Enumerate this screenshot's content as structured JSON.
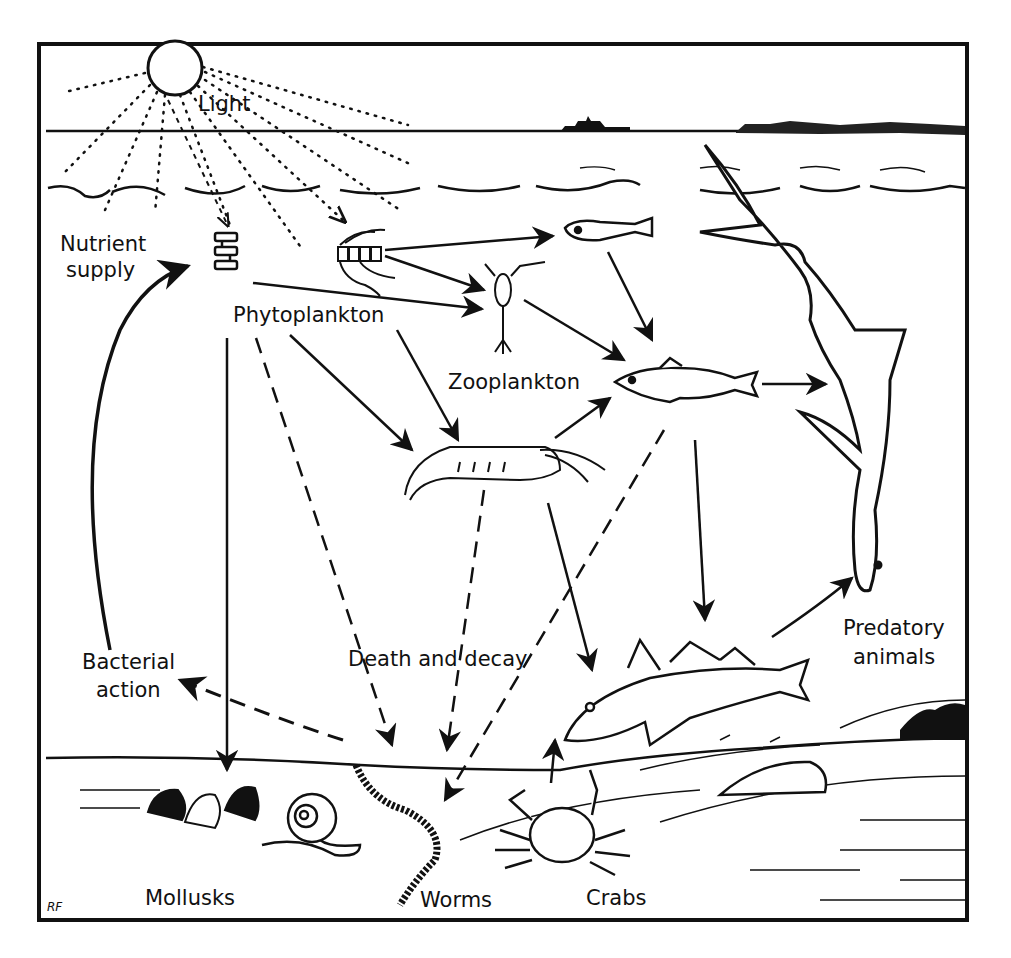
{
  "diagram": {
    "labels": {
      "light": "Light",
      "nutrient_supply_line1": "Nutrient",
      "nutrient_supply_line2": "supply",
      "phytoplankton": "Phytoplankton",
      "zooplankton": "Zooplankton",
      "predatory_line1": "Predatory",
      "predatory_line2": "animals",
      "bacterial_line1": "Bacterial",
      "bacterial_line2": "action",
      "death_decay": "Death and decay",
      "mollusks": "Mollusks",
      "worms": "Worms",
      "crabs": "Crabs"
    },
    "signature": "RF",
    "nodes": [
      {
        "id": "sun",
        "icon": "sun-icon"
      },
      {
        "id": "diatom-chain",
        "icon": "diatom-icon",
        "group": "Phytoplankton"
      },
      {
        "id": "diatom-cluster",
        "icon": "diatom-cluster-icon",
        "group": "Phytoplankton"
      },
      {
        "id": "copepod",
        "icon": "copepod-icon",
        "group": "Zooplankton"
      },
      {
        "id": "larval-fish",
        "icon": "larval-fish-icon",
        "group": "Zooplankton"
      },
      {
        "id": "shrimp",
        "icon": "shrimp-icon"
      },
      {
        "id": "small-fish",
        "icon": "small-fish-icon"
      },
      {
        "id": "shark",
        "icon": "shark-icon",
        "group": "Predatory animals"
      },
      {
        "id": "cod",
        "icon": "cod-icon",
        "group": "Predatory animals"
      },
      {
        "id": "clams",
        "icon": "clam-icon",
        "group": "Mollusks"
      },
      {
        "id": "snail",
        "icon": "snail-icon",
        "group": "Mollusks"
      },
      {
        "id": "worm",
        "icon": "worm-icon",
        "group": "Worms"
      },
      {
        "id": "crab",
        "icon": "crab-icon",
        "group": "Crabs"
      },
      {
        "id": "ship",
        "icon": "ship-icon"
      }
    ],
    "edges": [
      {
        "from": "sun",
        "to": "diatom-chain",
        "style": "dotted"
      },
      {
        "from": "sun",
        "to": "diatom-cluster",
        "style": "dotted"
      },
      {
        "from": "diatom-cluster",
        "to": "larval-fish",
        "style": "solid"
      },
      {
        "from": "diatom-cluster",
        "to": "copepod",
        "style": "solid"
      },
      {
        "from": "diatom-chain",
        "to": "copepod",
        "style": "solid"
      },
      {
        "from": "Phytoplankton",
        "to": "shrimp",
        "style": "solid"
      },
      {
        "from": "Phytoplankton",
        "to": "Mollusks",
        "style": "solid"
      },
      {
        "from": "larval-fish",
        "to": "small-fish",
        "style": "solid"
      },
      {
        "from": "copepod",
        "to": "small-fish",
        "style": "solid"
      },
      {
        "from": "shrimp",
        "to": "small-fish",
        "style": "solid"
      },
      {
        "from": "small-fish",
        "to": "shark",
        "style": "solid"
      },
      {
        "from": "small-fish",
        "to": "cod",
        "style": "solid"
      },
      {
        "from": "shrimp",
        "to": "cod",
        "style": "solid"
      },
      {
        "from": "crab",
        "to": "cod",
        "style": "solid"
      },
      {
        "from": "cod",
        "to": "shark",
        "style": "solid"
      },
      {
        "from": "Phytoplankton",
        "to": "Worms",
        "style": "dashed"
      },
      {
        "from": "shrimp",
        "to": "Worms",
        "style": "dashed"
      },
      {
        "from": "small-fish",
        "to": "Worms",
        "style": "dashed"
      },
      {
        "from": "Worms",
        "to": "Bacterial action",
        "style": "dashed"
      },
      {
        "from": "Bacterial action",
        "to": "Nutrient supply",
        "style": "solid-curved"
      }
    ]
  }
}
